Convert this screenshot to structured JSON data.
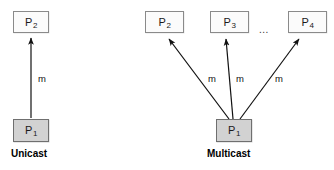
{
  "figure": {
    "background_color": "#ffffff",
    "line_color": "#111111",
    "sender_fill": "#d2d2d2",
    "receiver_fill": "#fbfbfb",
    "border_color": "#8a8a8a"
  },
  "unicast": {
    "caption": "Unicast",
    "sender": {
      "name": "P",
      "index": "1"
    },
    "receiver": {
      "name": "P",
      "index": "2"
    },
    "message_label": "m"
  },
  "multicast": {
    "caption": "Multicast",
    "sender": {
      "name": "P",
      "index": "1"
    },
    "receivers": [
      {
        "name": "P",
        "index": "2",
        "message_label": "m"
      },
      {
        "name": "P",
        "index": "3",
        "message_label": "m"
      },
      {
        "name": "P",
        "index": "4",
        "message_label": "m"
      }
    ],
    "ellipsis": "..."
  }
}
